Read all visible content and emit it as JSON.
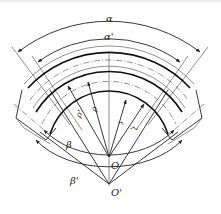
{
  "figure": {
    "type": "bend-geometry-diagram",
    "labels": {
      "alpha": "α",
      "alpha_prime": "α'",
      "beta": "β",
      "beta_prime": "β'",
      "rho": "ρ",
      "rho_prime": "ρ'",
      "r": "r",
      "r_prime": "r'",
      "center_O": "O",
      "center_O_prime": "O'"
    },
    "colors": {
      "line": "#222222",
      "background": "#ffffff"
    }
  }
}
